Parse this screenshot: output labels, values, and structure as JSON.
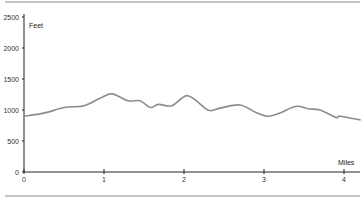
{
  "chart_data": {
    "type": "line",
    "title": "",
    "xlabel": "Miles",
    "ylabel": "Feet",
    "xlim": [
      0,
      4.2
    ],
    "ylim": [
      0,
      2500
    ],
    "x_ticks": [
      0,
      1,
      2,
      3,
      4
    ],
    "y_ticks": [
      0,
      500,
      1000,
      1500,
      2000,
      2500
    ],
    "grid": false,
    "legend": null,
    "line_color": "#8c8c8c",
    "series": [
      {
        "name": "Elevation",
        "x": [
          0,
          0.25,
          0.5,
          0.75,
          0.95,
          1.1,
          1.3,
          1.45,
          1.58,
          1.68,
          1.85,
          2.05,
          2.3,
          2.45,
          2.7,
          2.9,
          3.05,
          3.2,
          3.4,
          3.55,
          3.7,
          3.9,
          3.95,
          4.2
        ],
        "values": [
          900,
          950,
          1040,
          1070,
          1190,
          1260,
          1150,
          1150,
          1040,
          1090,
          1070,
          1230,
          1000,
          1030,
          1080,
          960,
          900,
          950,
          1060,
          1020,
          1000,
          880,
          900,
          840
        ]
      }
    ]
  },
  "axis": {
    "x_label": "Miles",
    "y_label": "Feet",
    "x_tick_labels": [
      "0",
      "1",
      "2",
      "3",
      "4"
    ],
    "y_tick_labels": [
      "0",
      "500",
      "1000",
      "1500",
      "2000",
      "2500"
    ]
  }
}
